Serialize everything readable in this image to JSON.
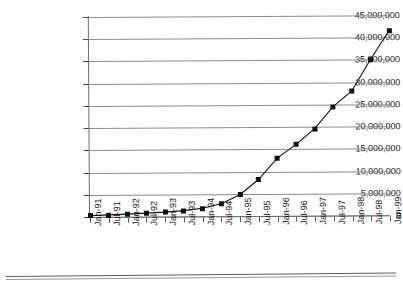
{
  "chart_data": {
    "type": "line",
    "title": "",
    "xlabel": "",
    "ylabel": "",
    "grid": true,
    "legend": false,
    "ylim": [
      0,
      45000000
    ],
    "ytick_labels": [
      "45,000,000",
      "40,000,000",
      "35,000,000",
      "30,000,000",
      "25,000,000",
      "20,000,000",
      "15,000,000",
      "10,000,000",
      "5,000,000",
      "0"
    ],
    "ytick_values": [
      45000000,
      40000000,
      35000000,
      30000000,
      25000000,
      20000000,
      15000000,
      10000000,
      5000000,
      0
    ],
    "categories": [
      "Jan-91",
      "Jul-91",
      "Jan-92",
      "Jul-92",
      "Jan-93",
      "Jul-93",
      "Jan-94",
      "Jul-94",
      "Jan-95",
      "Jul-95",
      "Jan-96",
      "Jul-96",
      "Jan-97",
      "Jul-97",
      "Jan-98",
      "Jul-98",
      "Jan-99"
    ],
    "values": [
      300000,
      450000,
      600000,
      800000,
      1000000,
      1300000,
      1800000,
      2800000,
      4800000,
      8200000,
      13000000,
      16000000,
      19500000,
      24500000,
      28000000,
      35000000,
      41500000
    ],
    "marker": "filled-square",
    "line_color": "#111111",
    "grid_color": "#8c8c8c"
  }
}
